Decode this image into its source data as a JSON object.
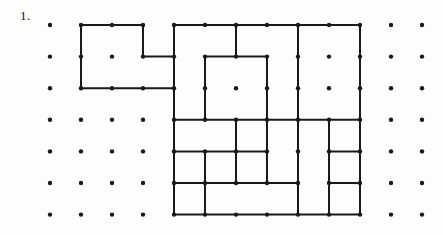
{
  "page": {
    "problem_number": "1.",
    "background_color": "#fdfdfc",
    "ink_color": "#1a1a1a"
  },
  "grid": {
    "origin_x": 50,
    "origin_y": 25,
    "spacing_x": 31,
    "spacing_y": 31.6,
    "cols": 13,
    "rows": 7,
    "dot_radius": 2.2,
    "dot_color": "#1a1a1a",
    "missing_dots": []
  },
  "stroke": {
    "width": 2.0,
    "color": "#1a1a1a",
    "linecap": "round",
    "linejoin": "miter"
  },
  "figures": [
    {
      "name": "small-l-shape",
      "label": "L shaped piece",
      "outline": [
        [
          1,
          0
        ],
        [
          3,
          0
        ],
        [
          3,
          1
        ],
        [
          4,
          1
        ],
        [
          4,
          2
        ],
        [
          1,
          2
        ]
      ],
      "closed": true,
      "interior_segments": []
    },
    {
      "name": "large-tiling-shape",
      "label": "Large region tiled with L pieces",
      "outline": [
        [
          4,
          0
        ],
        [
          10,
          0
        ],
        [
          10,
          6
        ],
        [
          4,
          6
        ]
      ],
      "closed": true,
      "interior_segments": [
        [
          [
            6,
            0
          ],
          [
            6,
            1
          ]
        ],
        [
          [
            5,
            1
          ],
          [
            7,
            1
          ]
        ],
        [
          [
            5,
            1
          ],
          [
            5,
            3
          ]
        ],
        [
          [
            7,
            1
          ],
          [
            7,
            2
          ]
        ],
        [
          [
            4,
            3
          ],
          [
            8,
            3
          ]
        ],
        [
          [
            7,
            2
          ],
          [
            7,
            5
          ]
        ],
        [
          [
            8,
            0
          ],
          [
            8,
            3
          ]
        ],
        [
          [
            5,
            4
          ],
          [
            7,
            4
          ]
        ],
        [
          [
            5,
            4
          ],
          [
            5,
            6
          ]
        ],
        [
          [
            6,
            3
          ],
          [
            6,
            5
          ]
        ],
        [
          [
            4,
            5
          ],
          [
            6,
            5
          ]
        ],
        [
          [
            8,
            3
          ],
          [
            8,
            6
          ]
        ],
        [
          [
            8,
            3
          ],
          [
            10,
            3
          ]
        ],
        [
          [
            9,
            3
          ],
          [
            9,
            6
          ]
        ],
        [
          [
            9,
            4
          ],
          [
            10,
            4
          ]
        ],
        [
          [
            9,
            4
          ],
          [
            9,
            5
          ]
        ],
        [
          [
            9,
            5
          ],
          [
            10,
            5
          ]
        ],
        [
          [
            6,
            5
          ],
          [
            8,
            5
          ]
        ],
        [
          [
            4,
            4
          ],
          [
            5,
            4
          ]
        ]
      ]
    }
  ]
}
